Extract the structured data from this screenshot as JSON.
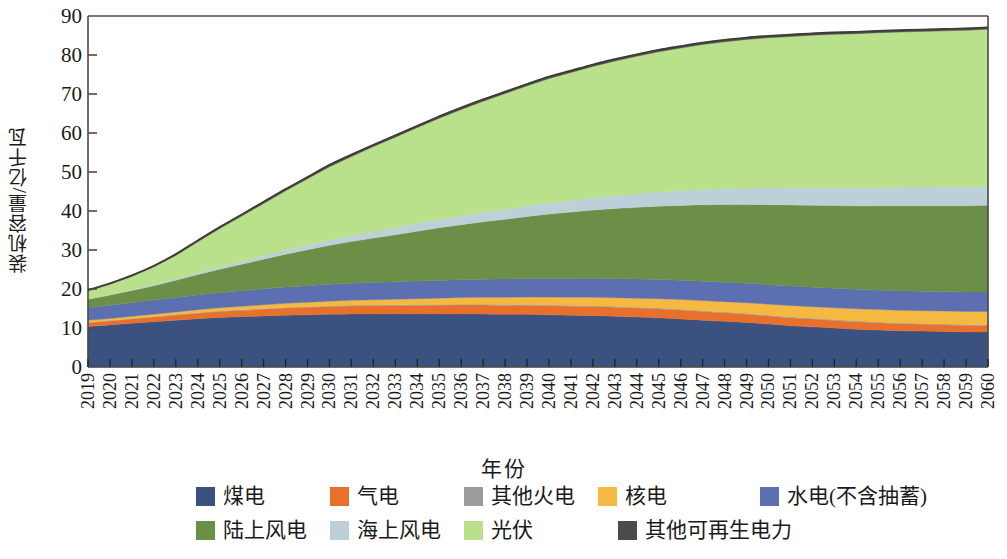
{
  "chart_data": {
    "type": "area",
    "stacked": true,
    "title": "",
    "xlabel": "年份",
    "ylabel": "装机容量/亿千瓦",
    "ylim": [
      0,
      90
    ],
    "yticks": [
      0,
      10,
      20,
      30,
      40,
      50,
      60,
      70,
      80,
      90
    ],
    "grid": false,
    "legend_position": "bottom",
    "x": [
      2019,
      2020,
      2021,
      2022,
      2023,
      2024,
      2025,
      2026,
      2027,
      2028,
      2029,
      2030,
      2031,
      2032,
      2033,
      2034,
      2035,
      2036,
      2037,
      2038,
      2039,
      2040,
      2041,
      2042,
      2043,
      2044,
      2045,
      2046,
      2047,
      2048,
      2049,
      2050,
      2051,
      2052,
      2053,
      2054,
      2055,
      2056,
      2057,
      2058,
      2059,
      2060
    ],
    "categories": [
      "2019",
      "2020",
      "2021",
      "2022",
      "2023",
      "2024",
      "2025",
      "2026",
      "2027",
      "2028",
      "2029",
      "2030",
      "2031",
      "2032",
      "2033",
      "2034",
      "2035",
      "2036",
      "2037",
      "2038",
      "2039",
      "2040",
      "2041",
      "2042",
      "2043",
      "2044",
      "2045",
      "2046",
      "2047",
      "2048",
      "2049",
      "2050",
      "2051",
      "2052",
      "2053",
      "2054",
      "2055",
      "2056",
      "2057",
      "2058",
      "2059",
      "2060"
    ],
    "series": [
      {
        "name": "煤电",
        "color": "#3b5280",
        "values": [
          10.4,
          10.8,
          11.2,
          11.6,
          12.0,
          12.4,
          12.7,
          12.9,
          13.1,
          13.3,
          13.4,
          13.5,
          13.6,
          13.6,
          13.6,
          13.6,
          13.6,
          13.6,
          13.6,
          13.5,
          13.5,
          13.4,
          13.3,
          13.2,
          13.0,
          12.8,
          12.6,
          12.3,
          12.0,
          11.7,
          11.4,
          11.0,
          10.6,
          10.3,
          10.0,
          9.7,
          9.5,
          9.3,
          9.2,
          9.1,
          9.0,
          9.0
        ]
      },
      {
        "name": "气电",
        "color": "#e8702a",
        "values": [
          0.95,
          1.0,
          1.1,
          1.2,
          1.3,
          1.4,
          1.5,
          1.6,
          1.7,
          1.8,
          1.9,
          2.0,
          2.05,
          2.1,
          2.15,
          2.2,
          2.25,
          2.3,
          2.3,
          2.3,
          2.3,
          2.3,
          2.3,
          2.3,
          2.3,
          2.3,
          2.3,
          2.3,
          2.25,
          2.2,
          2.15,
          2.1,
          2.05,
          2.0,
          1.95,
          1.9,
          1.85,
          1.8,
          1.75,
          1.7,
          1.65,
          1.6
        ]
      },
      {
        "name": "其他火电",
        "color": "#9b9b9b",
        "values": [
          0.12,
          0.12,
          0.13,
          0.13,
          0.14,
          0.14,
          0.15,
          0.15,
          0.16,
          0.16,
          0.17,
          0.17,
          0.18,
          0.18,
          0.18,
          0.19,
          0.19,
          0.19,
          0.2,
          0.2,
          0.2,
          0.2,
          0.2,
          0.2,
          0.2,
          0.2,
          0.2,
          0.2,
          0.2,
          0.2,
          0.2,
          0.2,
          0.2,
          0.2,
          0.2,
          0.2,
          0.2,
          0.2,
          0.2,
          0.2,
          0.2,
          0.2
        ]
      },
      {
        "name": "核电",
        "color": "#f5b942",
        "values": [
          0.49,
          0.52,
          0.56,
          0.62,
          0.68,
          0.75,
          0.82,
          0.9,
          0.98,
          1.06,
          1.14,
          1.22,
          1.3,
          1.38,
          1.46,
          1.54,
          1.62,
          1.7,
          1.78,
          1.86,
          1.94,
          2.02,
          2.1,
          2.18,
          2.26,
          2.34,
          2.42,
          2.5,
          2.58,
          2.66,
          2.74,
          2.82,
          2.9,
          2.98,
          3.05,
          3.12,
          3.18,
          3.24,
          3.3,
          3.35,
          3.4,
          3.45
        ]
      },
      {
        "name": "水电(不含抽蓄)",
        "color": "#5c6fb0",
        "values": [
          3.3,
          3.4,
          3.5,
          3.6,
          3.7,
          3.8,
          3.9,
          4.0,
          4.1,
          4.2,
          4.25,
          4.3,
          4.35,
          4.4,
          4.45,
          4.5,
          4.55,
          4.6,
          4.65,
          4.7,
          4.75,
          4.8,
          4.82,
          4.85,
          4.88,
          4.9,
          4.92,
          4.94,
          4.96,
          4.98,
          5.0,
          5.0,
          5.0,
          5.0,
          5.0,
          5.0,
          5.0,
          5.0,
          5.0,
          5.0,
          5.0,
          5.0
        ]
      },
      {
        "name": "陆上风电",
        "color": "#6b8f47",
        "values": [
          2.1,
          2.6,
          3.1,
          3.7,
          4.4,
          5.2,
          6.0,
          6.8,
          7.6,
          8.4,
          9.2,
          10.0,
          10.7,
          11.4,
          12.1,
          12.8,
          13.5,
          14.1,
          14.7,
          15.3,
          15.9,
          16.5,
          17.0,
          17.5,
          18.0,
          18.4,
          18.8,
          19.2,
          19.6,
          19.9,
          20.2,
          20.5,
          20.8,
          21.0,
          21.2,
          21.4,
          21.6,
          21.8,
          21.9,
          22.0,
          22.1,
          22.2
        ]
      },
      {
        "name": "海上风电",
        "color": "#bdd0d8",
        "values": [
          0.1,
          0.15,
          0.22,
          0.3,
          0.4,
          0.5,
          0.62,
          0.75,
          0.9,
          1.05,
          1.2,
          1.35,
          1.5,
          1.65,
          1.8,
          1.95,
          2.1,
          2.25,
          2.4,
          2.55,
          2.7,
          2.85,
          3.0,
          3.15,
          3.3,
          3.45,
          3.6,
          3.75,
          3.9,
          4.05,
          4.2,
          4.3,
          4.4,
          4.5,
          4.6,
          4.65,
          4.7,
          4.75,
          4.8,
          4.85,
          4.9,
          4.95
        ]
      },
      {
        "name": "光伏",
        "color": "#b9e08a",
        "values": [
          2.0,
          2.6,
          3.4,
          4.5,
          6.0,
          7.9,
          9.8,
          11.6,
          13.4,
          15.2,
          17.0,
          18.8,
          20.3,
          21.8,
          23.2,
          24.6,
          26.0,
          27.3,
          28.5,
          29.7,
          30.8,
          31.9,
          32.8,
          33.7,
          34.5,
          35.3,
          36.0,
          36.6,
          37.2,
          37.7,
          38.1,
          38.5,
          38.8,
          39.1,
          39.3,
          39.5,
          39.7,
          39.8,
          39.9,
          40.0,
          40.1,
          40.2
        ]
      },
      {
        "name": "其他可再生电力",
        "color": "#4d4a47",
        "values": [
          0.28,
          0.3,
          0.32,
          0.34,
          0.36,
          0.38,
          0.4,
          0.42,
          0.44,
          0.46,
          0.48,
          0.5,
          0.5,
          0.5,
          0.5,
          0.5,
          0.5,
          0.5,
          0.5,
          0.5,
          0.5,
          0.5,
          0.5,
          0.5,
          0.5,
          0.5,
          0.5,
          0.5,
          0.5,
          0.5,
          0.5,
          0.5,
          0.5,
          0.5,
          0.5,
          0.5,
          0.5,
          0.5,
          0.5,
          0.5,
          0.5,
          0.5
        ]
      }
    ]
  },
  "axes": {
    "ylabel": "装机容量/亿千瓦",
    "xlabel": "年份",
    "ytick_labels": [
      "0",
      "10",
      "20",
      "30",
      "40",
      "50",
      "60",
      "70",
      "80",
      "90"
    ]
  },
  "legend": {
    "items": [
      {
        "label": "煤电",
        "color": "#3b5280"
      },
      {
        "label": "气电",
        "color": "#e8702a"
      },
      {
        "label": "其他火电",
        "color": "#9b9b9b"
      },
      {
        "label": "核电",
        "color": "#f5b942"
      },
      {
        "label": "水电(不含抽蓄)",
        "color": "#5c6fb0"
      },
      {
        "label": "陆上风电",
        "color": "#6b8f47"
      },
      {
        "label": "海上风电",
        "color": "#bdd0d8"
      },
      {
        "label": "光伏",
        "color": "#b9e08a"
      },
      {
        "label": "其他可再生电力",
        "color": "#4d4a47"
      }
    ]
  },
  "style": {
    "axis_color": "#4a4a4a",
    "background": "#ffffff"
  }
}
